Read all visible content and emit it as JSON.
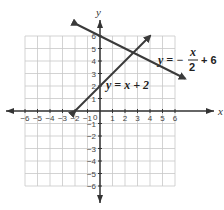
{
  "chart_data": {
    "type": "line",
    "title": "",
    "xlabel": "x",
    "ylabel": "y",
    "xlim": [
      -6,
      6
    ],
    "ylim": [
      -6,
      6
    ],
    "grid": true,
    "x_ticks": [
      "-6",
      "-5",
      "-4",
      "-3",
      "-2",
      "-1",
      "0",
      "1",
      "2",
      "3",
      "4",
      "5",
      "6"
    ],
    "y_ticks": [
      "6",
      "5",
      "4",
      "3",
      "2",
      "1",
      "-1",
      "-2",
      "-3",
      "-4",
      "-5",
      "-6"
    ],
    "series": [
      {
        "name": "y = x + 2",
        "equation": "y = x + 2",
        "slope": 1,
        "intercept": 2,
        "x": [
          -2,
          4
        ],
        "y": [
          0,
          6
        ]
      },
      {
        "name": "y = -x/2 + 6",
        "equation": "y = −x/2 + 6",
        "slope": -0.5,
        "intercept": 6,
        "x": [
          -1.8,
          6.8
        ],
        "y": [
          6.9,
          2.6
        ]
      }
    ],
    "intersection": {
      "x": 2.67,
      "y": 4.67
    },
    "annotations": [
      {
        "text": "y = x + 2",
        "near": [
          0.3,
          2
        ]
      },
      {
        "text": "y = −x/2 + 6",
        "near": [
          3.8,
          4.3
        ]
      }
    ]
  },
  "labels": {
    "x_axis": "x",
    "y_axis": "y",
    "origin": "0",
    "eq1": "y = x + 2",
    "eq2_lhs": "y = −",
    "eq2_num": "x",
    "eq2_den": "2",
    "eq2_rhs": "+ 6"
  }
}
